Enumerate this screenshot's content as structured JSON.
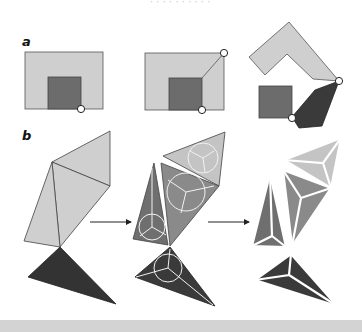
{
  "top_cut_text": "· · · · · · · · · ·",
  "panels": {
    "a": {
      "label": "a"
    },
    "b": {
      "label": "b"
    }
  },
  "colors": {
    "light_gray": "#cfcfcf",
    "mid_gray": "#6c6c6c",
    "dark_gray": "#3a3a3a",
    "triangle_mid": "#808080",
    "triangle_mid2": "#999999",
    "outline": "#555555",
    "hinge_fill": "#ffffff",
    "bottom_band": "#d3d3d3"
  }
}
